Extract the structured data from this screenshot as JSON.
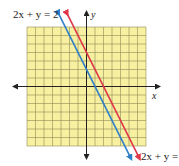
{
  "chart_data": {
    "type": "line",
    "title": "",
    "xlabel": "x",
    "ylabel": "y",
    "grid": true,
    "xlim": [
      -7,
      7
    ],
    "ylim": [
      -7,
      7
    ],
    "background_color": "#f7f0a0",
    "grid_color": "#8a8a5a",
    "series": [
      {
        "name": "2x + y = 2",
        "equation": "2x + y = 2",
        "slope": -2,
        "intercept": 2,
        "color": "#2f7fc8"
      },
      {
        "name": "2x + y = 4",
        "equation": "2x + y = 4",
        "slope": -2,
        "intercept": 4,
        "color": "#e0364a"
      }
    ]
  },
  "labels": {
    "top_left": "2x + y = 2",
    "bottom_right": "2x + y =",
    "x_axis": "x",
    "y_axis": "y"
  }
}
